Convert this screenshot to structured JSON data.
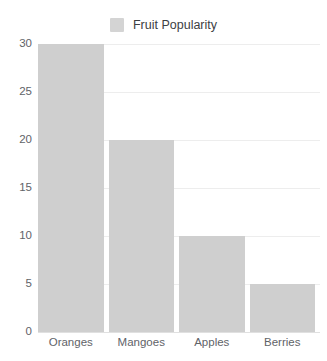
{
  "chart_data": {
    "type": "bar",
    "title": "",
    "subtitle": "",
    "categories": [
      "Oranges",
      "Mangoes",
      "Apples",
      "Berries"
    ],
    "values": [
      30,
      20,
      10,
      5
    ],
    "series": [
      {
        "name": "Fruit Popularity",
        "values": [
          30,
          20,
          10,
          5
        ]
      }
    ],
    "xlabel": "",
    "ylabel": "",
    "ylim": [
      0,
      30
    ],
    "yticks": [
      0,
      5,
      10,
      15,
      20,
      25,
      30
    ],
    "ytick_labels": [
      "0",
      "5",
      "10",
      "15",
      "20",
      "25",
      "30"
    ],
    "grid": true,
    "grid_axis": "y",
    "legend": {
      "visible": true,
      "position": "top",
      "entries": [
        {
          "label": "Fruit Popularity",
          "color": "#d4d4d4"
        }
      ]
    },
    "colors": {
      "bar": "#cfcfcf",
      "gridline": "#ededed",
      "baseline": "#e0e0e0",
      "tick_label": "#5f6368",
      "legend_label": "#3c4043",
      "background": "#ffffff"
    }
  }
}
